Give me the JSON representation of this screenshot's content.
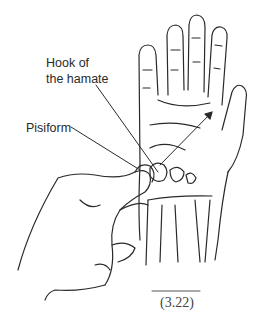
{
  "figure": {
    "labels": {
      "hook_line1": "Hook of",
      "hook_line2": "the hamate",
      "pisiform": "Pisiform"
    },
    "caption": "(3.22)",
    "colors": {
      "ink": "#2a2a2a",
      "background": "#ffffff"
    }
  }
}
